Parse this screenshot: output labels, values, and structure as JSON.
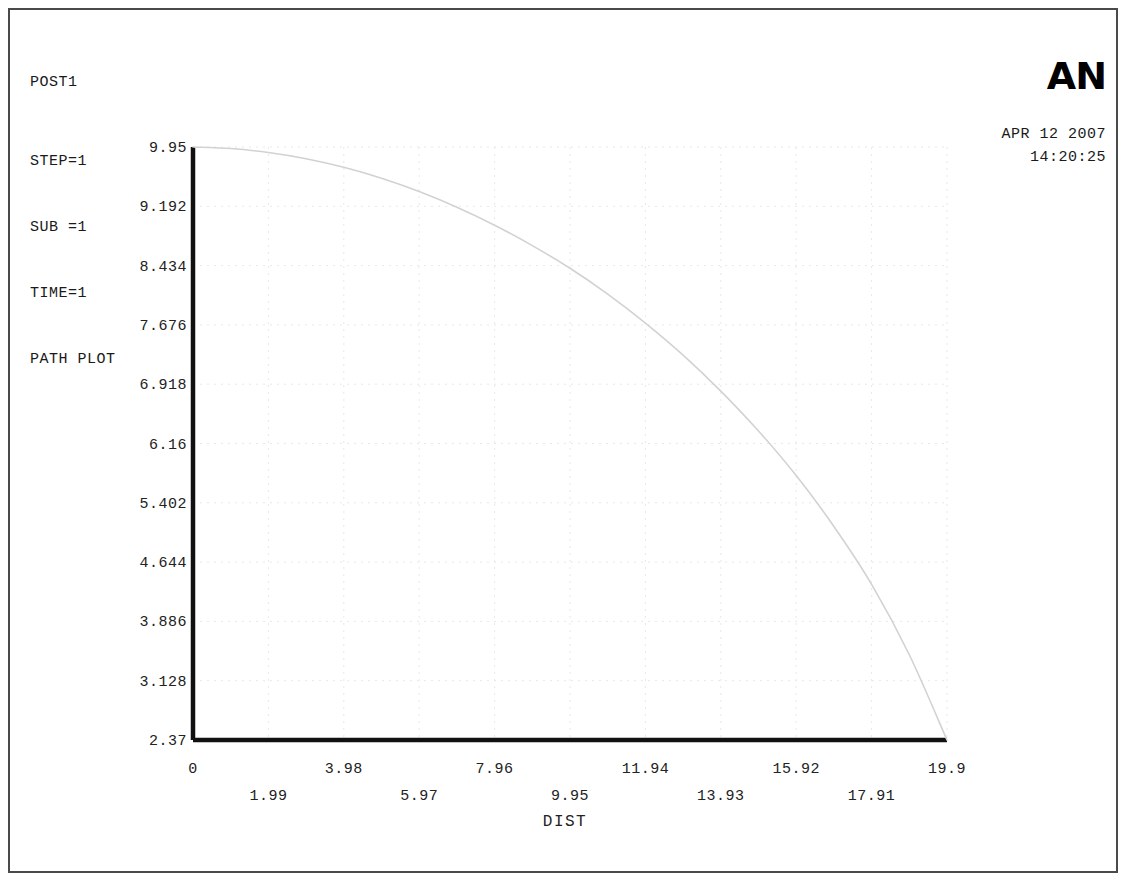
{
  "header": {
    "title": "POST1",
    "lines": [
      "STEP=1",
      "SUB =1",
      "TIME=1",
      "PATH PLOT"
    ],
    "logo": "AN",
    "date": "APR 12 2007",
    "time": "14:20:25"
  },
  "chart_data": {
    "type": "line",
    "title": "PATH PLOT",
    "xlabel": "DIST",
    "ylabel": "",
    "xlim": [
      0,
      19.9
    ],
    "ylim": [
      2.37,
      9.95
    ],
    "grid": true,
    "legend": "none",
    "x_ticks_upper": [
      "0",
      "3.98",
      "7.96",
      "11.94",
      "15.92",
      "19.9"
    ],
    "x_ticks_lower": [
      "1.99",
      "5.97",
      "9.95",
      "13.93",
      "17.91"
    ],
    "x_tick_values_upper": [
      0,
      3.98,
      7.96,
      11.94,
      15.92,
      19.9
    ],
    "x_tick_values_lower": [
      1.99,
      5.97,
      9.95,
      13.93,
      17.91
    ],
    "y_ticks": [
      "9.95",
      "9.192",
      "8.434",
      "7.676",
      "6.918",
      "6.16",
      "5.402",
      "4.644",
      "3.886",
      "3.128",
      "2.37"
    ],
    "y_tick_values": [
      9.95,
      9.192,
      8.434,
      7.676,
      6.918,
      6.16,
      5.402,
      4.644,
      3.886,
      3.128,
      2.37
    ],
    "series": [
      {
        "name": "PATH PLOT",
        "color": "#d2d2d2",
        "x": [
          0,
          0.995,
          1.99,
          2.985,
          3.98,
          4.975,
          5.97,
          6.965,
          7.96,
          8.955,
          9.95,
          10.945,
          11.94,
          12.935,
          13.93,
          14.925,
          15.92,
          16.915,
          17.91,
          18.905,
          19.9
        ],
        "y": [
          9.95,
          9.93,
          9.88,
          9.8,
          9.69,
          9.55,
          9.38,
          9.18,
          8.95,
          8.69,
          8.4,
          8.07,
          7.7,
          7.29,
          6.83,
          6.32,
          5.75,
          5.1,
          4.36,
          3.46,
          2.37
        ]
      }
    ]
  },
  "colors": {
    "axis": "#111111",
    "grid": "#e8e8e8",
    "curve": "#d2d2d2",
    "frame": "#4a4a4a"
  }
}
